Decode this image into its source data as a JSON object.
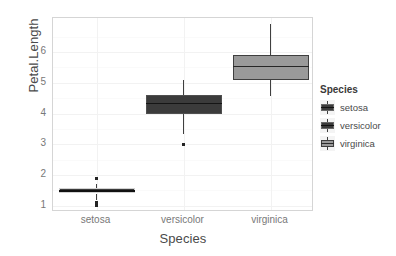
{
  "chart_data": {
    "type": "box",
    "title": "",
    "xlabel": "Species",
    "ylabel": "Petal.Length",
    "categories": [
      "setosa",
      "versicolor",
      "virginica"
    ],
    "ylim": [
      0.8,
      7.1
    ],
    "yticks": [
      1,
      2,
      3,
      4,
      5,
      6
    ],
    "ytick_labels": [
      "1",
      "2",
      "3",
      "4",
      "5",
      "6"
    ],
    "grid": true,
    "legend_position": "right",
    "legend_title": "Species",
    "legend_entries": [
      {
        "label": "setosa",
        "fill": "#3b3b3b"
      },
      {
        "label": "versicolor",
        "fill": "#3b3b3b"
      },
      {
        "label": "virginica",
        "fill": "#9a9a9a"
      }
    ],
    "boxes": [
      {
        "name": "setosa",
        "fill": "#3b3b3b",
        "border": "#d2d2d2",
        "median_color": "#111111",
        "lower_whisker": 1.2,
        "q1": 1.4,
        "median": 1.5,
        "q3": 1.575,
        "upper_whisker": 1.7,
        "outliers": [
          1.9,
          1.1,
          1.0
        ]
      },
      {
        "name": "versicolor",
        "fill": "#3b3b3b",
        "border": "#4f4f4f",
        "median_color": "#151515",
        "lower_whisker": 3.35,
        "q1": 4.0,
        "median": 4.35,
        "q3": 4.6,
        "upper_whisker": 5.1,
        "outliers": [
          3.0
        ]
      },
      {
        "name": "virginica",
        "fill": "#9a9a9a",
        "border": "#3f3f3f",
        "median_color": "#262626",
        "lower_whisker": 4.55,
        "q1": 5.1,
        "median": 5.55,
        "q3": 5.9,
        "upper_whisker": 6.9,
        "outliers": []
      }
    ]
  },
  "axes": {
    "y_title": "Petal.Length",
    "x_title": "Species"
  },
  "legend": {
    "title": "Species"
  }
}
